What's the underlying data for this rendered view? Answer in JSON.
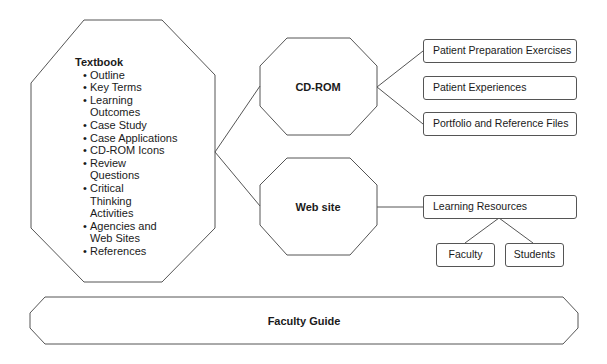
{
  "textbook": {
    "title": "Textbook",
    "items": [
      "Outline",
      "Key Terms",
      "Learning Outcomes",
      "Case Study",
      "Case Applications",
      "CD-ROM Icons",
      "Review Questions",
      "Critical Thinking Activities",
      "Agencies and Web Sites",
      "References"
    ]
  },
  "cdrom": {
    "title": "CD-ROM",
    "children": [
      "Patient Preparation Exercises",
      "Patient Experiences",
      "Portfolio and Reference Files"
    ]
  },
  "website": {
    "title": "Web site",
    "child": "Learning Resources",
    "grandchildren": [
      "Faculty",
      "Students"
    ]
  },
  "faculty_guide": {
    "title": "Faculty Guide"
  },
  "colors": {
    "stroke": "#555555",
    "text": "#1a1a1a",
    "background": "#ffffff"
  }
}
